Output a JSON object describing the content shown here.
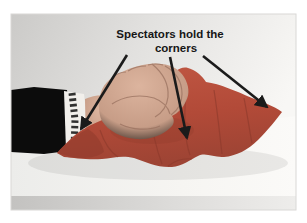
{
  "figure": {
    "annotation": {
      "line1": "Spectators hold the",
      "line2": "corners"
    },
    "arrows": [
      {
        "name": "arrow-to-left-corner",
        "points_at": "left corner of handkerchief"
      },
      {
        "name": "arrow-to-bottom-corner",
        "points_at": "bottom corner of handkerchief"
      },
      {
        "name": "arrow-to-right-corner",
        "points_at": "right corner of handkerchief"
      }
    ],
    "colors": {
      "handkerchief_red": "#b24a38",
      "handkerchief_shadow": "#8f3a2c",
      "sleeve_black": "#0c0c0c",
      "arrow_black": "#1b1b1b",
      "text_black": "#161616",
      "photo_background_gray": "#cdccca",
      "table_white": "#f4f3f0",
      "skin_tone": "#c79d87"
    }
  }
}
